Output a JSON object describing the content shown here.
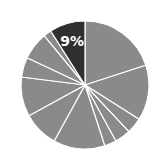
{
  "chart_data": {
    "type": "pie",
    "title": "",
    "start_angle_deg": 0,
    "direction": "clockwise",
    "center": [
      85,
      85
    ],
    "radius": 64,
    "slice_color": "#8a8a8a",
    "highlight_color": "#2f2f2f",
    "separator_color": "#ffffff",
    "label_color": "#ffffff",
    "slices": [
      {
        "value": 20,
        "highlight": false,
        "label": ""
      },
      {
        "value": 14,
        "highlight": false,
        "label": ""
      },
      {
        "value": 4,
        "highlight": false,
        "label": ""
      },
      {
        "value": 4,
        "highlight": false,
        "label": ""
      },
      {
        "value": 3,
        "highlight": false,
        "label": ""
      },
      {
        "value": 13,
        "highlight": false,
        "label": ""
      },
      {
        "value": 9,
        "highlight": false,
        "label": ""
      },
      {
        "value": 10,
        "highlight": false,
        "label": ""
      },
      {
        "value": 5,
        "highlight": false,
        "label": ""
      },
      {
        "value": 7,
        "highlight": false,
        "label": ""
      },
      {
        "value": 2,
        "highlight": false,
        "label": ""
      },
      {
        "value": 9,
        "highlight": true,
        "label": "9%"
      }
    ]
  }
}
